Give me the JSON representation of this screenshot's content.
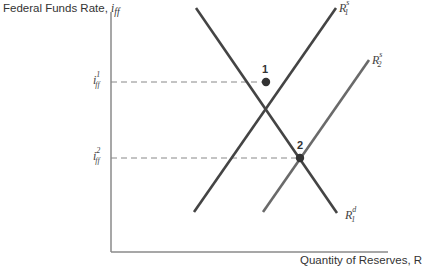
{
  "axes": {
    "y_label": "Federal Funds Rate, ",
    "y_label_symbol": "i",
    "y_label_sub": "ff",
    "x_label": "Quantity of Reserves, R"
  },
  "curves": {
    "supply1": {
      "name": "R",
      "sup": "s",
      "sub": "1"
    },
    "supply2": {
      "name": "R",
      "sup": "s",
      "sub": "2"
    },
    "demand1": {
      "name": "R",
      "sup": "d",
      "sub": "1"
    }
  },
  "ticks": {
    "i1": {
      "name": "i",
      "sub": "ff",
      "sup": "1"
    },
    "i2": {
      "name": "i",
      "sub": "ff",
      "sup": "2"
    }
  },
  "points": {
    "p1": "1",
    "p2": "2"
  },
  "colors": {
    "line": "#444444",
    "supply2": "#666666",
    "dashed": "#888888",
    "axis": "#777777"
  }
}
